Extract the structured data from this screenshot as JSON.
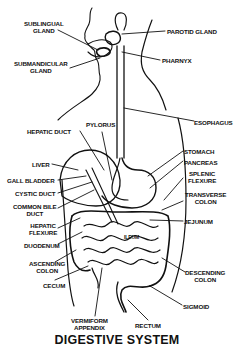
{
  "title": "DIGESTIVE SYSTEM",
  "labels": {
    "sublingual_gland": [
      "SUBLINGUAL",
      "GLAND"
    ],
    "submandibular_gland": [
      "SUBMANDICULAR",
      "GLAND"
    ],
    "parotid_gland": "PAROTID GLAND",
    "pharynx": "PHARNYX",
    "esophagus": "ESOPHAGUS",
    "hepatic_duct": "HEPATIC DUCT",
    "pylorus": "PYLORUS",
    "liver": "LIVER",
    "gall_bladder": "GALL BLADDER",
    "cystic_duct": "CYSTIC DUCT",
    "common_bile_duct": [
      "COMMON BILE",
      "DUCT"
    ],
    "hepatic_flexure": [
      "HEPATIC",
      "FLEXURE"
    ],
    "duodenum": "DUODENUM",
    "ascending_colon": [
      "ASCENDING",
      "COLON"
    ],
    "cecum": "CECUM",
    "vermiform_appendix": [
      "VERMIFORM",
      "APPENDIX"
    ],
    "rectum": "RECTUM",
    "sigmoid": "SIGMOID",
    "descending_colon": [
      "DESCENDING",
      "COLON"
    ],
    "jejunum": "JEJUNUM",
    "transverse_colon": [
      "TRANSVERSE",
      "COLON"
    ],
    "splenic_flexure": [
      "SPLENIC",
      "FLEXURE"
    ],
    "pancreas": "PANCREAS",
    "stomach": "STOMACH",
    "ileum": "ILEUM"
  }
}
